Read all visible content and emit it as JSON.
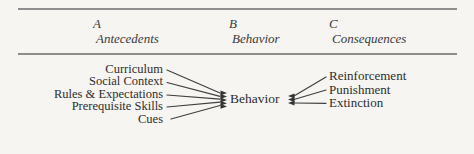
{
  "header": {
    "columns": [
      {
        "letter": "A",
        "label": "Antecedents"
      },
      {
        "letter": "B",
        "label": "Behavior"
      },
      {
        "letter": "C",
        "label": "Consequences"
      }
    ]
  },
  "diagram": {
    "antecedents": [
      "Curriculum",
      "Social Context",
      "Rules & Expectations",
      "Prerequisite Skills",
      "Cues"
    ],
    "behavior_label": "Behavior",
    "consequences": [
      "Reinforcement",
      "Punishment",
      "Extinction"
    ]
  },
  "colors": {
    "background": "#f6f5f2",
    "text": "#2e2e2e",
    "rule": "#8d8d8d",
    "connector_line": "#3f3f3f"
  }
}
